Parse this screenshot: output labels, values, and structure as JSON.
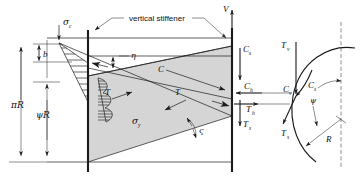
{
  "figure": {
    "annotation_text": "vertical stiffener"
  },
  "labels": {
    "sigma_c": "σ",
    "sigma_c_sub": "c",
    "sigma_y": "σ",
    "sigma_y_sub": "y",
    "b": "b",
    "piR": "πR",
    "psiR": "ψR",
    "eta": "η",
    "zeta": "ς",
    "psi": "ψ",
    "C": "C",
    "T_left": "T",
    "T_mid": "T",
    "V": "V",
    "Cs": "C",
    "Cs_sub": "s",
    "Ch": "C",
    "Ch_sub": "h",
    "Th": "T",
    "Th_sub": "h",
    "Ts": "T",
    "Ts_sub": "s",
    "Tv": "T",
    "Tv_sub": "v",
    "Cv": "C",
    "Cv_sub": "v",
    "Cs2": "C",
    "Cs2_sub": "s",
    "Ts2": "T",
    "Ts2_sub": "s",
    "R": "R"
  },
  "colors": {
    "ink": "#1b1b1b",
    "band_fill": "#d5d5d5",
    "background": "#ffffff",
    "hatch": "#1b1b1b"
  },
  "geometry": {
    "panel_left_x": 47,
    "panel_stiffener_x": 88,
    "panel_right_x": 232,
    "panel_top_y": 38,
    "panel_bottom_y": 162,
    "pi_R_dim_label": "πR",
    "psi_R_dim_label": "ψR",
    "arc_radius_label": "R"
  }
}
